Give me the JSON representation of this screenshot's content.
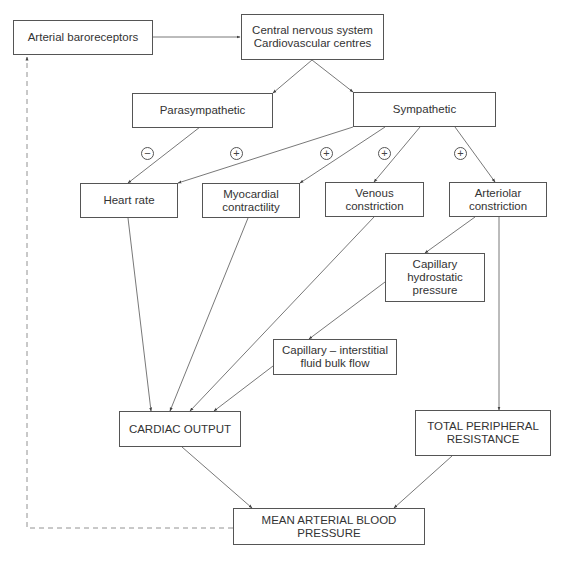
{
  "nodes": {
    "baroreceptors": "Arterial baroreceptors",
    "cns": "Central nervous system\nCardiovascular centres",
    "parasympathetic": "Parasympathetic",
    "sympathetic": "Sympathetic",
    "heart_rate": "Heart rate",
    "myocardial": "Myocardial\ncontractility",
    "venous": "Venous\nconstriction",
    "arteriolar": "Arteriolar\nconstriction",
    "cap_hydro": "Capillary\nhydrostatic\npressure",
    "cap_interstitial": "Capillary – interstitial\nfluid bulk flow",
    "cardiac_output": "CARDIAC OUTPUT",
    "tpr": "TOTAL PERIPHERAL\nRESISTANCE",
    "map": "MEAN ARTERIAL BLOOD PRESSURE"
  },
  "signs": {
    "parasympathetic_heart_rate": "−",
    "sympathetic_heart_rate": "+",
    "sympathetic_myocardial": "+",
    "sympathetic_venous": "+",
    "sympathetic_arteriolar": "+"
  },
  "colors": {
    "line": "#555555",
    "dashed_line": "#777777"
  }
}
